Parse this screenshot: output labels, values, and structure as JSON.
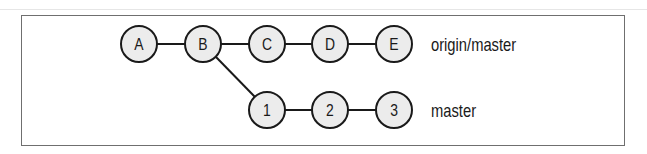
{
  "diagram": {
    "type": "git-commit-graph",
    "nodes": [
      {
        "id": "A",
        "label": "A",
        "row": 0
      },
      {
        "id": "B",
        "label": "B",
        "row": 0
      },
      {
        "id": "C",
        "label": "C",
        "row": 0
      },
      {
        "id": "D",
        "label": "D",
        "row": 0
      },
      {
        "id": "E",
        "label": "E",
        "row": 0
      },
      {
        "id": "1",
        "label": "1",
        "row": 1
      },
      {
        "id": "2",
        "label": "2",
        "row": 1
      },
      {
        "id": "3",
        "label": "3",
        "row": 1
      }
    ],
    "edges": [
      [
        "A",
        "B"
      ],
      [
        "B",
        "C"
      ],
      [
        "C",
        "D"
      ],
      [
        "D",
        "E"
      ],
      [
        "B",
        "1"
      ],
      [
        "1",
        "2"
      ],
      [
        "2",
        "3"
      ]
    ],
    "branches": [
      {
        "label": "origin/master",
        "points_to": "E"
      },
      {
        "label": "master",
        "points_to": "3"
      }
    ],
    "colors": {
      "node_fill": "#ececec",
      "node_stroke": "#1a1a1a",
      "edge": "#1a1a1a",
      "frame": "#6f6f6f"
    }
  }
}
